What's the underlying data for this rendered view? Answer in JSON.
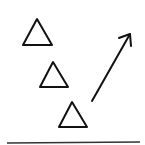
{
  "diagram": {
    "stroke_color": "#111111",
    "background": "#ffffff",
    "triangles": [
      {
        "apex": [
          37,
          19
        ],
        "left": [
          23,
          45
        ],
        "right": [
          52,
          45
        ]
      },
      {
        "apex": [
          53,
          62
        ],
        "left": [
          40,
          87
        ],
        "right": [
          68,
          87
        ]
      },
      {
        "apex": [
          72,
          102
        ],
        "left": [
          59,
          127
        ],
        "right": [
          87,
          127
        ]
      }
    ],
    "arrow": {
      "from": [
        92,
        101
      ],
      "to": [
        130,
        34
      ]
    },
    "baseline": {
      "from": [
        7,
        143
      ],
      "to": [
        140,
        142
      ]
    }
  }
}
